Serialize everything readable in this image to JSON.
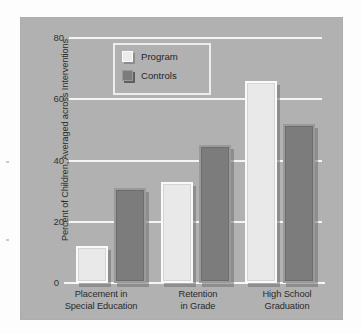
{
  "chart_data": {
    "type": "bar",
    "title": "",
    "xlabel": "",
    "ylabel": "Percent of Children, Averaged across Interventions",
    "ylim": [
      0,
      80
    ],
    "yticks": [
      0,
      20,
      40,
      60,
      80
    ],
    "ytick_labels": [
      "0",
      "20",
      "40",
      "60",
      "80"
    ],
    "grid": true,
    "legend_position": "upper-left-inside",
    "categories": [
      "Placement in\nSpecial Education",
      "Retention\nin Grade",
      "High School\nGraduation"
    ],
    "category_lines": [
      [
        "Placement in",
        "Special Education"
      ],
      [
        "Retention",
        "in Grade"
      ],
      [
        "High School",
        "Graduation"
      ]
    ],
    "series": [
      {
        "name": "Program",
        "values": [
          12,
          33,
          66
        ],
        "color": "#e9e9e9"
      },
      {
        "name": "Controls",
        "values": [
          31,
          45,
          52
        ],
        "color": "#7c7c7c"
      }
    ]
  },
  "legend": {
    "items": [
      {
        "label": "Program",
        "swatch": "program-swatch"
      },
      {
        "label": "Controls",
        "swatch": "controls-swatch"
      }
    ]
  },
  "colors": {
    "figure_background": "#fdfdfd",
    "panel_background": "#b1b1b1",
    "gridline": "#f4f4f4",
    "program_bar": "#e9e9e9",
    "controls_bar": "#7c7c7c",
    "text": "#2b2b2b"
  }
}
